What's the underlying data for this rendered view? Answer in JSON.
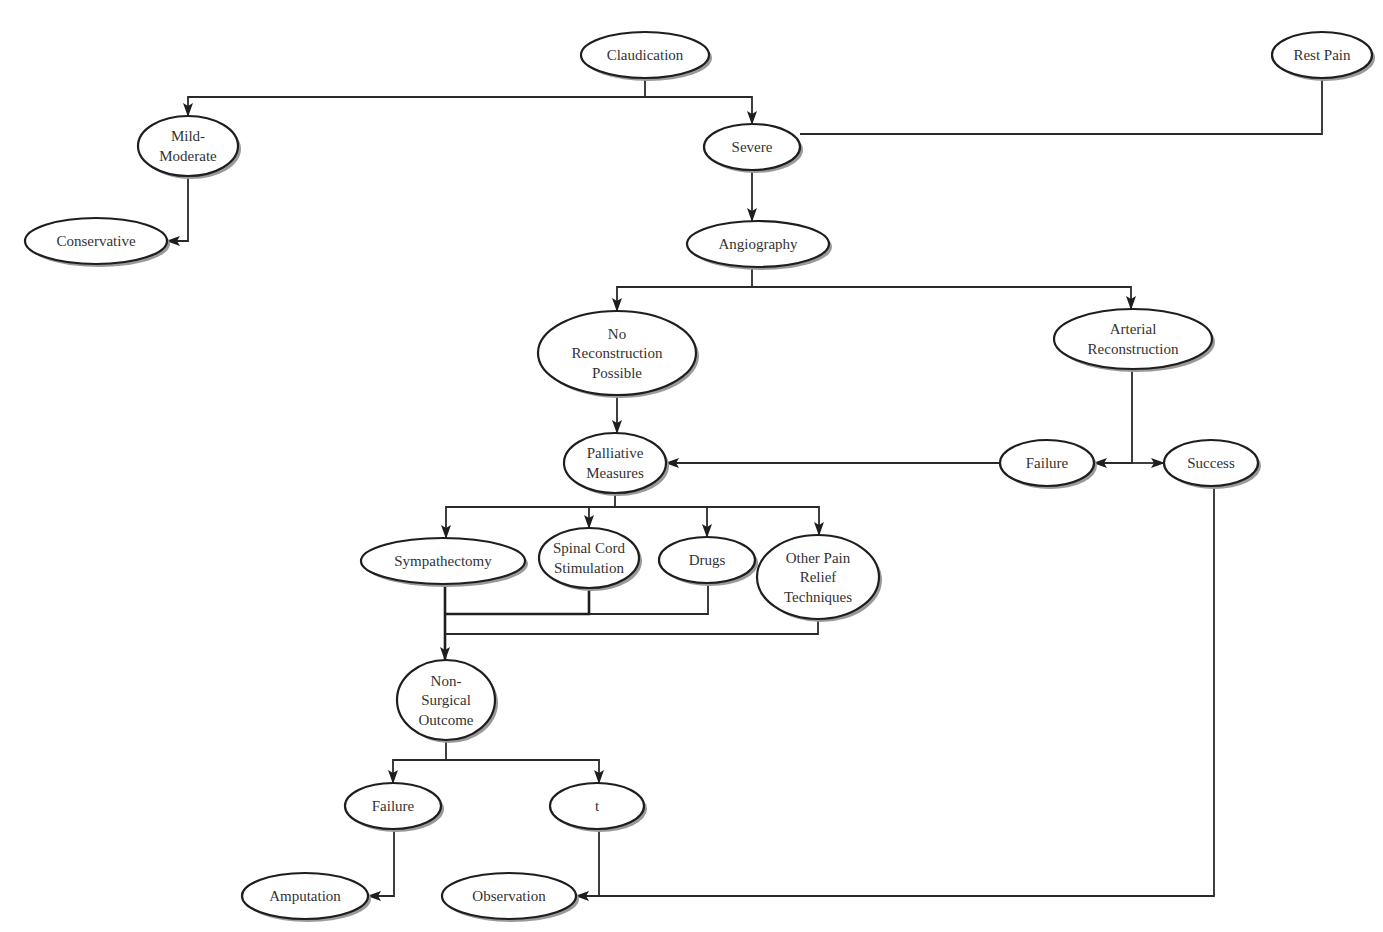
{
  "diagram": {
    "type": "flowchart",
    "title": "",
    "nodes": [
      {
        "id": "claudication",
        "label": "Claudication",
        "lines": [
          "Claudication"
        ],
        "cx": 645,
        "cy": 55,
        "rx": 64,
        "ry": 23
      },
      {
        "id": "rest_pain",
        "label": "Rest Pain",
        "lines": [
          "Rest Pain"
        ],
        "cx": 1322,
        "cy": 55,
        "rx": 50,
        "ry": 23
      },
      {
        "id": "mild_moderate",
        "label": "Mild-Moderate",
        "lines": [
          "Mild-",
          "Moderate"
        ],
        "cx": 188,
        "cy": 146,
        "rx": 50,
        "ry": 30
      },
      {
        "id": "severe",
        "label": "Severe",
        "lines": [
          "Severe"
        ],
        "cx": 752,
        "cy": 147,
        "rx": 48,
        "ry": 23
      },
      {
        "id": "conservative",
        "label": "Conservative",
        "lines": [
          "Conservative"
        ],
        "cx": 96,
        "cy": 241,
        "rx": 71,
        "ry": 23
      },
      {
        "id": "angiography",
        "label": "Angiography",
        "lines": [
          "Angiography"
        ],
        "cx": 758,
        "cy": 244,
        "rx": 71,
        "ry": 23
      },
      {
        "id": "no_reconstruction",
        "label": "No Reconstruction Possible",
        "lines": [
          "No",
          "Reconstruction",
          "Possible"
        ],
        "cx": 617,
        "cy": 353,
        "rx": 79,
        "ry": 42
      },
      {
        "id": "arterial_reconstruction",
        "label": "Arterial Reconstruction",
        "lines": [
          "Arterial",
          "Reconstruction"
        ],
        "cx": 1133,
        "cy": 339,
        "rx": 79,
        "ry": 30
      },
      {
        "id": "palliative_measures",
        "label": "Palliative Measures",
        "lines": [
          "Palliative",
          "Measures"
        ],
        "cx": 615,
        "cy": 463,
        "rx": 51,
        "ry": 30
      },
      {
        "id": "failure_reconstruction",
        "label": "Failure",
        "lines": [
          "Failure"
        ],
        "cx": 1047,
        "cy": 463,
        "rx": 47,
        "ry": 23
      },
      {
        "id": "success",
        "label": "Success",
        "lines": [
          "Success"
        ],
        "cx": 1211,
        "cy": 463,
        "rx": 47,
        "ry": 23
      },
      {
        "id": "sympathectomy",
        "label": "Sympathectomy",
        "lines": [
          "Sympathectomy"
        ],
        "cx": 443,
        "cy": 561,
        "rx": 82,
        "ry": 23
      },
      {
        "id": "spinal_cord_stimulation",
        "label": "Spinal Cord Stimulation",
        "lines": [
          "Spinal Cord",
          "Stimulation"
        ],
        "cx": 589,
        "cy": 558,
        "rx": 50,
        "ry": 30
      },
      {
        "id": "drugs",
        "label": "Drugs",
        "lines": [
          "Drugs"
        ],
        "cx": 707,
        "cy": 560,
        "rx": 48,
        "ry": 23
      },
      {
        "id": "other_pain_relief",
        "label": "Other Pain Relief Techniques",
        "lines": [
          "Other Pain",
          "Relief",
          "Techniques"
        ],
        "cx": 818,
        "cy": 577,
        "rx": 61,
        "ry": 42
      },
      {
        "id": "non_surgical_outcome",
        "label": "Non-Surgical Outcome",
        "lines": [
          "Non-",
          "Surgical",
          "Outcome"
        ],
        "cx": 446,
        "cy": 700,
        "rx": 49,
        "ry": 40
      },
      {
        "id": "failure_outcome",
        "label": "Failure",
        "lines": [
          "Failure"
        ],
        "cx": 393,
        "cy": 806,
        "rx": 48,
        "ry": 23
      },
      {
        "id": "t_outcome",
        "label": "t",
        "lines": [
          "t"
        ],
        "cx": 597,
        "cy": 806,
        "rx": 47,
        "ry": 23
      },
      {
        "id": "amputation",
        "label": "Amputation",
        "lines": [
          "Amputation"
        ],
        "cx": 305,
        "cy": 896,
        "rx": 63,
        "ry": 23
      },
      {
        "id": "observation",
        "label": "Observation",
        "lines": [
          "Observation"
        ],
        "cx": 509,
        "cy": 896,
        "rx": 67,
        "ry": 23
      }
    ],
    "edges": [
      {
        "from": "claudication",
        "to": "mild_moderate",
        "points": [
          [
            645,
            78
          ],
          [
            645,
            97
          ],
          [
            188,
            97
          ],
          [
            188,
            116
          ]
        ],
        "arrow": true
      },
      {
        "from": "claudication",
        "to": "severe",
        "points": [
          [
            645,
            97
          ],
          [
            752,
            97
          ],
          [
            752,
            124
          ]
        ],
        "arrow": true
      },
      {
        "from": "rest_pain",
        "to": "severe",
        "points": [
          [
            1322,
            78
          ],
          [
            1322,
            134
          ],
          [
            800,
            134
          ]
        ],
        "arrow": false
      },
      {
        "from": "mild_moderate",
        "to": "conservative",
        "points": [
          [
            188,
            176
          ],
          [
            188,
            241
          ],
          [
            167,
            241
          ]
        ],
        "arrow": true
      },
      {
        "from": "severe",
        "to": "angiography",
        "points": [
          [
            752,
            170
          ],
          [
            752,
            221
          ]
        ],
        "arrow": true
      },
      {
        "from": "angiography",
        "to": "no_reconstruction",
        "points": [
          [
            752,
            267
          ],
          [
            752,
            287
          ],
          [
            617,
            287
          ],
          [
            617,
            311
          ]
        ],
        "arrow": true
      },
      {
        "from": "angiography",
        "to": "arterial_reconstruction",
        "points": [
          [
            752,
            287
          ],
          [
            1131,
            287
          ],
          [
            1131,
            309
          ]
        ],
        "arrow": true
      },
      {
        "from": "no_reconstruction",
        "to": "palliative_measures",
        "points": [
          [
            617,
            395
          ],
          [
            617,
            433
          ]
        ],
        "arrow": true
      },
      {
        "from": "arterial_reconstruction",
        "to": "failure_reconstruction",
        "points": [
          [
            1132,
            369
          ],
          [
            1132,
            463
          ],
          [
            1094,
            463
          ]
        ],
        "arrow": true
      },
      {
        "from": "arterial_reconstruction",
        "to": "success",
        "points": [
          [
            1132,
            463
          ],
          [
            1164,
            463
          ]
        ],
        "arrow": true
      },
      {
        "from": "failure_reconstruction",
        "to": "palliative_measures",
        "points": [
          [
            1000,
            463
          ],
          [
            666,
            463
          ]
        ],
        "arrow": true
      },
      {
        "from": "palliative_measures",
        "to": "sympathectomy",
        "points": [
          [
            615,
            493
          ],
          [
            615,
            507
          ],
          [
            446,
            507
          ],
          [
            446,
            538
          ]
        ],
        "arrow": true
      },
      {
        "from": "palliative_measures",
        "to": "spinal_cord_stimulation",
        "points": [
          [
            589,
            507
          ],
          [
            589,
            528
          ]
        ],
        "arrow": true
      },
      {
        "from": "palliative_measures",
        "to": "drugs",
        "points": [
          [
            615,
            507
          ],
          [
            707,
            507
          ],
          [
            707,
            537
          ]
        ],
        "arrow": true
      },
      {
        "from": "palliative_measures",
        "to": "other_pain_relief",
        "points": [
          [
            707,
            507
          ],
          [
            819,
            507
          ],
          [
            819,
            535
          ]
        ],
        "arrow": true
      },
      {
        "from": "sympathectomy",
        "to": "non_surgical_outcome",
        "points": [
          [
            445,
            584
          ],
          [
            445,
            660
          ]
        ],
        "arrow": true,
        "bold": true
      },
      {
        "from": "spinal_cord_stimulation",
        "to": "non_surgical_outcome",
        "points": [
          [
            589,
            588
          ],
          [
            589,
            614
          ],
          [
            445,
            614
          ]
        ],
        "arrow": false,
        "bold": true
      },
      {
        "from": "drugs",
        "to": "non_surgical_outcome",
        "points": [
          [
            708,
            583
          ],
          [
            708,
            614
          ],
          [
            589,
            614
          ]
        ],
        "arrow": false
      },
      {
        "from": "other_pain_relief",
        "to": "non_surgical_outcome",
        "points": [
          [
            818,
            619
          ],
          [
            818,
            634
          ],
          [
            445,
            634
          ]
        ],
        "arrow": false
      },
      {
        "from": "non_surgical_outcome",
        "to": "failure_outcome",
        "points": [
          [
            446,
            740
          ],
          [
            446,
            760
          ],
          [
            393,
            760
          ],
          [
            393,
            783
          ]
        ],
        "arrow": true
      },
      {
        "from": "non_surgical_outcome",
        "to": "t_outcome",
        "points": [
          [
            446,
            760
          ],
          [
            599,
            760
          ],
          [
            599,
            783
          ]
        ],
        "arrow": true
      },
      {
        "from": "failure_outcome",
        "to": "amputation",
        "points": [
          [
            394,
            829
          ],
          [
            394,
            896
          ],
          [
            368,
            896
          ]
        ],
        "arrow": true
      },
      {
        "from": "t_outcome",
        "to": "observation",
        "points": [
          [
            599,
            829
          ],
          [
            599,
            896
          ],
          [
            576,
            896
          ]
        ],
        "arrow": true
      },
      {
        "from": "success",
        "to": "observation",
        "points": [
          [
            1214,
            486
          ],
          [
            1214,
            896
          ],
          [
            599,
            896
          ]
        ],
        "arrow": false
      }
    ],
    "colors": {
      "background": "#ffffff",
      "node_fill": "#ffffff",
      "node_stroke": "#1e1e1e",
      "node_shadow": "#9a9a9a",
      "edge": "#2a2a2a",
      "text": "#333333"
    }
  }
}
